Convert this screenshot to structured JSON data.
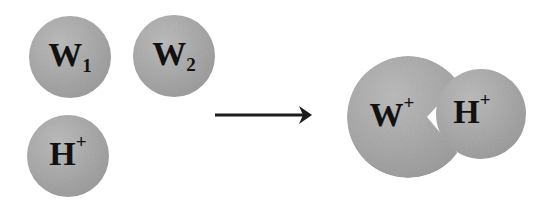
{
  "figure": {
    "background_color": "#ffffff",
    "sphere_fill_color": "#a8a8a8",
    "text_color": "#111111",
    "arrow_color": "#1c1c1c",
    "wedge_color": "#ffffff"
  },
  "reactants": {
    "label": "reactants",
    "spheres": [
      {
        "id": "w1",
        "name": "tryptophan-1-sphere",
        "main": "W",
        "sub": "1",
        "sup": "",
        "cx": 70,
        "cy": 57,
        "r": 41
      },
      {
        "id": "w2",
        "name": "tryptophan-2-sphere",
        "main": "W",
        "sub": "2",
        "sup": "",
        "cx": 174,
        "cy": 56,
        "r": 41
      },
      {
        "id": "h_plus_reactant",
        "name": "proton-sphere",
        "main": "H",
        "sub": "",
        "sup": "+",
        "cx": 68,
        "cy": 156,
        "r": 41
      }
    ]
  },
  "arrow": {
    "name": "reaction-arrow",
    "label": "reaction arrow",
    "direction": "right",
    "x_start": 215,
    "x_end": 312,
    "y": 115
  },
  "products": {
    "label": "products",
    "spheres": [
      {
        "id": "w_cation",
        "name": "tryptophan-cation-sphere",
        "main": "W",
        "sub": "",
        "sup": "+",
        "cx": 408,
        "cy": 117,
        "r": 61
      },
      {
        "id": "h_plus_product",
        "name": "proton-product-sphere",
        "main": "H",
        "sub": "",
        "sup": "+",
        "cx": 481,
        "cy": 114,
        "r": 45
      }
    ],
    "wedge": {
      "name": "white-wedge-notch",
      "apex_x": 427,
      "apex_y": 117,
      "top_x": 470,
      "top_y": 70,
      "bottom_x": 470,
      "bottom_y": 168
    }
  }
}
